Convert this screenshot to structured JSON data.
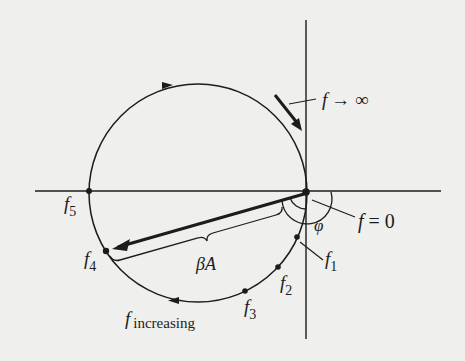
{
  "diagram": {
    "type": "polar-loop-gain-plot",
    "colors": {
      "background": "#efefed",
      "ink": "#1c1c1c"
    },
    "axes": {
      "origin": [
        306,
        192
      ],
      "horizontal": {
        "x1": 35,
        "x2": 441,
        "y": 191
      },
      "vertical": {
        "x": 306,
        "y1": 20,
        "y2": 339
      }
    },
    "circle": {
      "cx": 198,
      "cy": 193,
      "r": 109
    },
    "points": [
      {
        "id": "f0",
        "x": 306,
        "y": 192
      },
      {
        "id": "f1",
        "x": 297,
        "y": 237
      },
      {
        "id": "f2",
        "x": 278,
        "y": 267
      },
      {
        "id": "f3",
        "x": 245,
        "y": 291
      },
      {
        "id": "f4",
        "x": 106,
        "y": 251
      },
      {
        "id": "f5",
        "x": 89,
        "y": 191
      }
    ],
    "labels": {
      "f_infinity": {
        "f": "f",
        "rest": "→ ∞"
      },
      "f_zero": {
        "f": "f",
        "rest": "= 0"
      },
      "phi": "φ",
      "beta_a": "βA",
      "f1": {
        "f": "f",
        "sub": "1"
      },
      "f2": {
        "f": "f",
        "sub": "2"
      },
      "f3": {
        "f": "f",
        "sub": "3"
      },
      "f4": {
        "f": "f",
        "sub": "4"
      },
      "f5": {
        "f": "f",
        "sub": "5"
      },
      "f_increasing": {
        "f": "f",
        "sub": "increasing"
      }
    }
  }
}
